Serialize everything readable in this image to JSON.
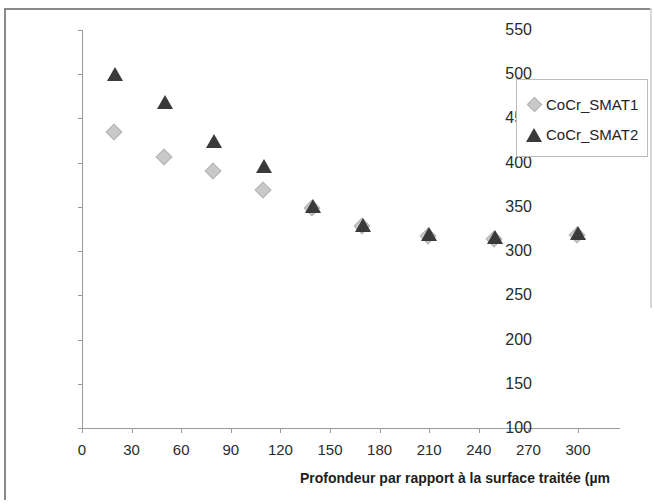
{
  "chart_data": {
    "type": "scatter",
    "title": "",
    "xlabel": "Profondeur par rapport à la surface traitée (µm",
    "ylabel": "Microdureté Vickers (Hv0,2)",
    "xlim": [
      0,
      300
    ],
    "ylim": [
      100,
      550
    ],
    "xticks": [
      "0",
      "30",
      "60",
      "90",
      "120",
      "150",
      "180",
      "210",
      "240",
      "270",
      "300"
    ],
    "yticks": [
      "100",
      "150",
      "200",
      "250",
      "300",
      "350",
      "400",
      "450",
      "500",
      "550"
    ],
    "grid": false,
    "legend_position": "top-right",
    "x": [
      20,
      50,
      80,
      110,
      140,
      170,
      210,
      250,
      300
    ],
    "series": [
      {
        "name": "CoCr_SMAT1",
        "marker": "diamond",
        "color": "#c9c9c9",
        "values": [
          433,
          405,
          390,
          368,
          348,
          327,
          316,
          313,
          317
        ]
      },
      {
        "name": "CoCr_SMAT2",
        "marker": "triangle",
        "color": "#3a3a3a",
        "values": [
          500,
          469,
          425,
          396,
          351,
          330,
          319,
          316,
          320
        ]
      }
    ]
  },
  "legend": {
    "entries": [
      {
        "label": "CoCr_SMAT1",
        "marker": "diamond"
      },
      {
        "label": "CoCr_SMAT2",
        "marker": "triangle"
      }
    ]
  }
}
